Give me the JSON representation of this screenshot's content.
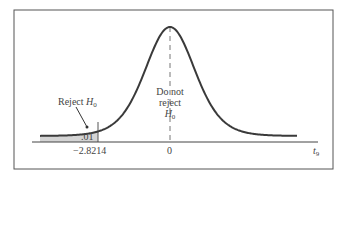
{
  "chart_data": {
    "type": "area",
    "title": "",
    "distribution": "Student t, 9 degrees of freedom",
    "xlabel": "t_9",
    "ylabel": "",
    "x_ticks": [
      "-2.8214",
      "0"
    ],
    "critical_value": -2.8214,
    "tail_probability": 0.01,
    "shaded_region": "left tail, t < -2.8214",
    "annotations": [
      "Reject H0",
      ".01",
      "Do not reject H0"
    ],
    "grid": false,
    "legend": null
  },
  "labels": {
    "reject": "Reject ",
    "reject_h": "H",
    "reject_sub": "0",
    "alpha": ".01",
    "crit": "−2.8214",
    "zero": "0",
    "axis_t": "t",
    "axis_sub": "9",
    "dnr_line1": "Do not",
    "dnr_line2": "reject",
    "dnr_h": "H",
    "dnr_sub": "0"
  },
  "colors": {
    "curve": "#3a3a3a",
    "shade": "#d4d4d4",
    "frame": "#555555",
    "dash": "#777777"
  }
}
